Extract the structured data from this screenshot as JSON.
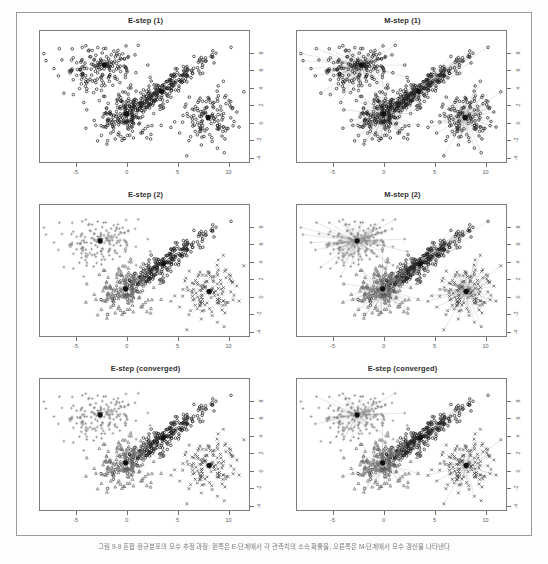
{
  "figure": {
    "caption": "그림 9-9  혼합 정규분포의 모수 추정 과정: 왼쪽은 E-단계에서 각 관측치의 소속 확률을, 오른쪽은 M-단계에서 모수 갱신을 나타낸다",
    "panels": [
      {
        "id": "e-step-1",
        "title": "E-step (1)",
        "phase": "E",
        "iteration": "1",
        "show_rays": false
      },
      {
        "id": "m-step-1",
        "title": "M-step (1)",
        "phase": "M",
        "iteration": "1",
        "show_rays": true
      },
      {
        "id": "e-step-2",
        "title": "E-step (2)",
        "phase": "E",
        "iteration": "2",
        "show_rays": false
      },
      {
        "id": "m-step-2",
        "title": "M-step (2)",
        "phase": "M",
        "iteration": "2",
        "show_rays": true
      },
      {
        "id": "e-step-converged-left",
        "title": "E-step (converged)",
        "phase": "E",
        "iteration": "converged",
        "show_rays": false
      },
      {
        "id": "e-step-converged-right",
        "title": "E-step (converged)",
        "phase": "E",
        "iteration": "converged",
        "show_rays": true
      }
    ]
  },
  "chart_data": {
    "type": "scatter",
    "xlabel": "",
    "ylabel": "",
    "xlim": [
      -8.5,
      12.0
    ],
    "ylim": [
      -4.5,
      10.5
    ],
    "xticks": [
      -5,
      0,
      5,
      10
    ],
    "xticklabels": [
      "-5",
      "0",
      "5",
      "10"
    ],
    "yticks": [
      -4,
      -2,
      0,
      2,
      4,
      6,
      8
    ],
    "yticklabels": [
      "-4",
      "-2",
      "0",
      "2",
      "4",
      "6",
      "8"
    ],
    "grid": false,
    "legend": "none",
    "marker_symbols": [
      "circle",
      "plus",
      "triangle",
      "cross"
    ],
    "colors": {
      "ink": "#2b2b2b",
      "axis": "#7d7d7d",
      "ray": "#9e9e9e",
      "marker_circle": "#1e1e1e",
      "marker_plus": "#8d8d8d",
      "marker_triangle": "#6f6f6f",
      "marker_cross": "#4a4a4a",
      "centroid": "#101010",
      "page_background": "#ffffff",
      "frame": "#9a9a9a"
    },
    "clusters": [
      {
        "name": "cluster-1-upper-left",
        "marker": "plus",
        "n": 170,
        "center_initial": [
          -2.2,
          6.6
        ],
        "center_converged": [
          -2.6,
          6.4
        ],
        "spread": [
          2.0,
          1.25
        ],
        "correlation": 0.15
      },
      {
        "name": "cluster-2-diagonal-band",
        "marker": "circle",
        "n": 260,
        "center_initial": [
          3.4,
          3.6
        ],
        "center_converged": [
          3.6,
          3.8
        ],
        "spread": [
          2.1,
          1.85
        ],
        "correlation": 0.93
      },
      {
        "name": "cluster-3-lower-middle",
        "marker": "triangle",
        "n": 175,
        "center_initial": [
          0.0,
          1.0
        ],
        "center_converged": [
          -0.1,
          0.9
        ],
        "spread": [
          1.45,
          1.45
        ],
        "correlation": 0.05
      },
      {
        "name": "cluster-4-right",
        "marker": "cross",
        "n": 130,
        "center_initial": [
          8.0,
          0.6
        ],
        "center_converged": [
          8.1,
          0.6
        ],
        "spread": [
          1.4,
          1.6
        ],
        "correlation": 0.0
      }
    ]
  }
}
